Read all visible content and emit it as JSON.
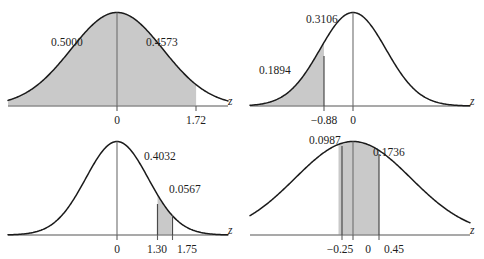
{
  "figure": {
    "panel_count": 4,
    "curve_color": "#1b1b1b",
    "shade_color": "#c9c9c9",
    "axis_color": "#8d8d8d",
    "background_color": "#ffffff"
  },
  "chart_data": [
    {
      "type": "area",
      "title": "",
      "xlabel": "z",
      "ylabel": "",
      "distribution": "standard normal",
      "xlim": [
        -3.6,
        3.6
      ],
      "ylim": [
        0,
        0.42
      ],
      "grid": false,
      "legend": "none",
      "tick_labels": [
        "0",
        "1.72"
      ],
      "tick_values": [
        0,
        1.72
      ],
      "vertical_lines": [
        0
      ],
      "shaded_intervals": [
        [
          -3.6,
          1.72
        ]
      ],
      "annotations": [
        {
          "text": "0.5000",
          "z_interval": [
            -3.6,
            0
          ],
          "value": 0.5
        },
        {
          "text": "0.4573",
          "z_interval": [
            0,
            1.72
          ],
          "value": 0.4573
        }
      ]
    },
    {
      "type": "area",
      "title": "",
      "xlabel": "z",
      "ylabel": "",
      "distribution": "standard normal",
      "xlim": [
        -3.6,
        3.6
      ],
      "ylim": [
        0,
        0.42
      ],
      "grid": false,
      "legend": "none",
      "tick_labels": [
        "−0.88",
        "0"
      ],
      "tick_values": [
        -0.88,
        0
      ],
      "vertical_lines": [
        -0.88,
        0
      ],
      "shaded_intervals": [
        [
          -3.6,
          -0.88
        ]
      ],
      "annotations": [
        {
          "text": "0.3106",
          "z_interval": [
            -0.88,
            0
          ],
          "value": 0.3106
        },
        {
          "text": "0.1894",
          "z_interval": [
            -3.6,
            -0.88
          ],
          "value": 0.1894
        }
      ]
    },
    {
      "type": "area",
      "title": "",
      "xlabel": "z",
      "ylabel": "",
      "distribution": "standard normal",
      "xlim": [
        -3.6,
        3.6
      ],
      "ylim": [
        0,
        0.42
      ],
      "grid": false,
      "legend": "none",
      "tick_labels": [
        "0",
        "1.30",
        "1.75"
      ],
      "tick_values": [
        0,
        1.3,
        1.75
      ],
      "vertical_lines": [
        0
      ],
      "shaded_intervals": [
        [
          1.3,
          1.75
        ]
      ],
      "annotations": [
        {
          "text": "0.4032",
          "z_interval": [
            0,
            1.3
          ],
          "value": 0.4032
        },
        {
          "text": "0.0567",
          "z_interval": [
            1.3,
            1.75
          ],
          "value": 0.0567
        }
      ]
    },
    {
      "type": "area",
      "title": "",
      "xlabel": "z",
      "ylabel": "",
      "distribution": "standard normal",
      "xlim": [
        -3.6,
        3.6
      ],
      "ylim": [
        0,
        0.42
      ],
      "grid": false,
      "legend": "none",
      "tick_labels": [
        "−0.25",
        "0",
        "0.45"
      ],
      "tick_values": [
        -0.25,
        0,
        0.45
      ],
      "vertical_lines": [
        0
      ],
      "shaded_intervals": [
        [
          -0.25,
          0.45
        ]
      ],
      "annotations": [
        {
          "text": "0.0987",
          "z_interval": [
            -0.25,
            0
          ],
          "value": 0.0987
        },
        {
          "text": "0.1736",
          "z_interval": [
            0,
            0.45
          ],
          "value": 0.1736
        }
      ]
    }
  ],
  "panels": [
    {
      "id": "panel-top-left",
      "axis_label": "z",
      "ticks": [
        {
          "label": "0",
          "x": 117
        },
        {
          "label": "1.72",
          "x": 196
        }
      ],
      "area_labels": [
        {
          "text": "0.5000",
          "x": 75,
          "y": 46
        },
        {
          "text": "0.4573",
          "x": 170,
          "y": 46
        }
      ]
    },
    {
      "id": "panel-top-right",
      "axis_label": "z",
      "ticks": [
        {
          "label": "−0.88",
          "x": 82
        },
        {
          "label": "0",
          "x": 111
        }
      ],
      "area_labels": [
        {
          "text": "0.3106",
          "x": 88,
          "y": 23
        },
        {
          "text": "0.1894",
          "x": 41,
          "y": 74
        }
      ]
    },
    {
      "id": "panel-bottom-left",
      "axis_label": "z",
      "ticks": [
        {
          "label": "0",
          "x": 117
        },
        {
          "label": "1.30",
          "x": 158
        },
        {
          "label": "1.75",
          "x": 187
        }
      ],
      "area_labels": [
        {
          "text": "0.4032",
          "x": 168,
          "y": 31
        },
        {
          "text": "0.0567",
          "x": 193,
          "y": 64
        }
      ]
    },
    {
      "id": "panel-bottom-right",
      "axis_label": "z",
      "ticks": [
        {
          "label": "−0.25",
          "x": 100
        },
        {
          "label": "0",
          "x": 128
        },
        {
          "label": "0.45",
          "x": 154
        }
      ],
      "area_labels": [
        {
          "text": "0.0987",
          "x": 91,
          "y": 15
        },
        {
          "text": "0.1736",
          "x": 155,
          "y": 27
        }
      ]
    }
  ]
}
